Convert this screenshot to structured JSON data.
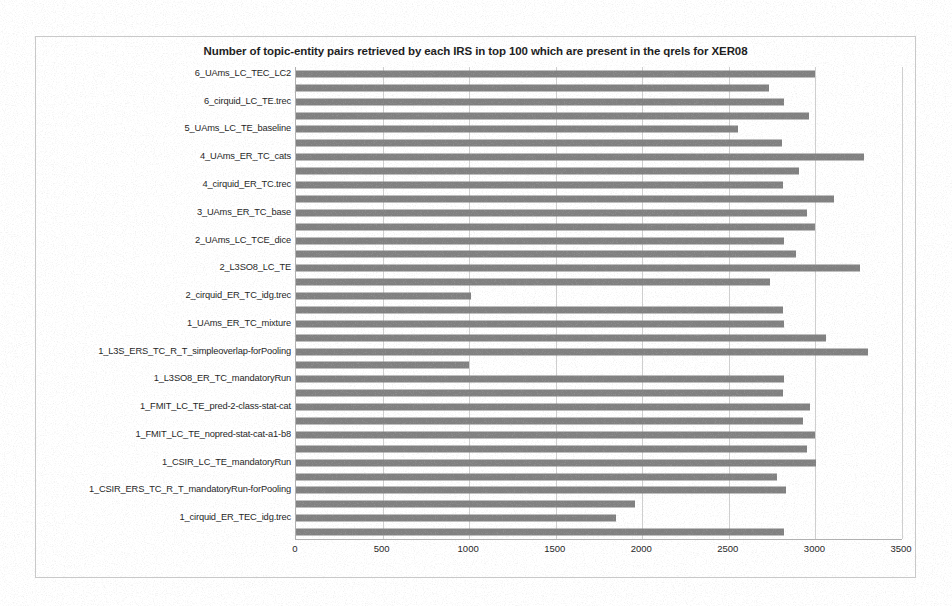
{
  "chart_data": {
    "type": "bar",
    "orientation": "horizontal",
    "title": "Number of topic-entity pairs retrieved by each IRS in top 100 which are present in the qrels for XER08",
    "xlabel": "",
    "ylabel": "",
    "xlim": [
      0,
      3500
    ],
    "xticks": [
      0,
      500,
      1000,
      1500,
      2000,
      2500,
      3000,
      3500
    ],
    "xtick_labels": [
      "0",
      "500",
      "1000",
      "1500",
      "2000",
      "2500",
      "3000",
      "3500"
    ],
    "grid": true,
    "legend": false,
    "bar_color": "#808080",
    "categories": [
      "6_UAms_LC_TEC_LC2",
      "",
      "6_cirquid_LC_TE.trec",
      "",
      "5_UAms_LC_TE_baseline",
      "",
      "4_UAms_ER_TC_cats",
      "",
      "4_cirquid_ER_TC.trec",
      "",
      "3_UAms_ER_TC_base",
      "",
      "2_UAms_LC_TCE_dice",
      "",
      "2_L3SO8_LC_TE",
      "",
      "2_cirquid_ER_TC_idg.trec",
      "",
      "1_UAms_ER_TC_mixture",
      "",
      "1_L3S_ERS_TC_R_T_simpleoverlap-forPooling",
      "",
      "1_L3SO8_ER_TC_mandatoryRun",
      "",
      "1_FMIT_LC_TE_pred-2-class-stat-cat",
      "",
      "1_FMIT_LC_TE_nopred-stat-cat-a1-b8",
      "",
      "1_CSIR_LC_TE_mandatoryRun",
      "",
      "1_CSIR_ERS_TC_R_T_mandatoryRun-forPooling",
      "",
      "1_cirquid_ER_TEC_idg.trec",
      ""
    ],
    "values": [
      3000,
      2730,
      2820,
      2965,
      2555,
      2805,
      3280,
      2905,
      2810,
      3105,
      2950,
      3000,
      2820,
      2890,
      3260,
      2740,
      1010,
      2815,
      2820,
      3060,
      3305,
      1000,
      2820,
      2810,
      2970,
      2930,
      3000,
      2950,
      3005,
      2780,
      2830,
      1960,
      1850,
      2820
    ]
  }
}
